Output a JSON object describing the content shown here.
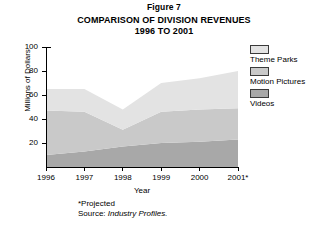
{
  "figure": {
    "number_label": "Figure 7",
    "title_line1": "COMPARISON OF DIVISION REVENUES",
    "title_line2": "1996 TO 2001"
  },
  "footnotes": {
    "projected": "*Projected",
    "source_prefix": "Source: ",
    "source_name": "Industry Profiles."
  },
  "legend": {
    "items": [
      {
        "label": "Theme Parks",
        "color": "#e3e3e3"
      },
      {
        "label": "Motion Pictures",
        "color": "#c9c9c9"
      },
      {
        "label": "Videos",
        "color": "#a8a8a8"
      }
    ]
  },
  "axes": {
    "y_ticks": [
      "100",
      "80",
      "60",
      "40",
      "20"
    ],
    "x_ticks": [
      "1996",
      "1997",
      "1998",
      "1999",
      "2000",
      "2001*"
    ]
  },
  "chart_data": {
    "type": "area",
    "title": "COMPARISON OF DIVISION REVENUES 1996 TO 2001",
    "xlabel": "Year",
    "ylabel": "Millions of Dollars",
    "categories": [
      "1996",
      "1997",
      "1998",
      "1999",
      "2000",
      "2001*"
    ],
    "ylim": [
      0,
      100
    ],
    "xlim": [
      1996,
      2001
    ],
    "y_tick_values": [
      0,
      20,
      40,
      60,
      80,
      100
    ],
    "grid": false,
    "stacked": true,
    "legend_position": "right",
    "annotations": [
      "*Projected",
      "Source: Industry Profiles."
    ],
    "series": [
      {
        "name": "Videos",
        "color": "#a8a8a8",
        "values": [
          10,
          13,
          17,
          20,
          21,
          23
        ]
      },
      {
        "name": "Motion Pictures",
        "color": "#c9c9c9",
        "values": [
          37,
          33,
          14,
          26,
          27,
          26
        ]
      },
      {
        "name": "Theme Parks",
        "color": "#e3e3e3",
        "values": [
          18,
          19,
          17,
          24,
          26,
          31
        ]
      }
    ],
    "cumulative_tops": {
      "Videos": [
        10,
        13,
        17,
        20,
        21,
        23
      ],
      "Motion Pictures": [
        47,
        46,
        31,
        46,
        48,
        49
      ],
      "Theme Parks": [
        65,
        65,
        48,
        70,
        74,
        80
      ]
    }
  }
}
